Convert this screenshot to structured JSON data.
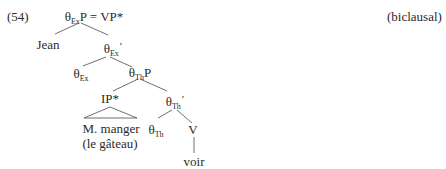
{
  "example": {
    "number": "(54)",
    "tag": "(biclausal)"
  },
  "tree": {
    "root": {
      "theta": "θ",
      "sub": "Ex",
      "label": "P",
      "rest": " = VP*"
    },
    "jean": {
      "text": "Jean"
    },
    "ex_bar": {
      "theta": "θ",
      "sub": "Ex",
      "prime": "′"
    },
    "ex_head": {
      "theta": "θ",
      "sub": "Ex"
    },
    "th_p": {
      "theta": "θ",
      "sub": "Th",
      "label": "P"
    },
    "ip": {
      "text": "IP*"
    },
    "ip_content": {
      "line1": "M. manger",
      "line2": "(le gâteau)"
    },
    "th_bar": {
      "theta": "θ",
      "sub": "Th",
      "prime": "′"
    },
    "th_head": {
      "theta": "θ",
      "sub": "Th"
    },
    "v": {
      "text": "V"
    },
    "verb": {
      "text": "voir"
    }
  }
}
